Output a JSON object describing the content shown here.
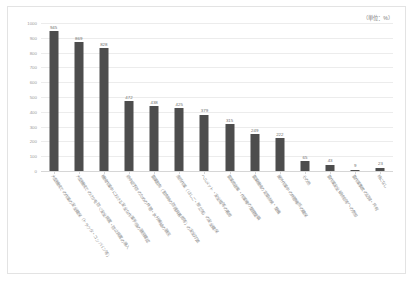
{
  "unit_caption": "（単位：%）",
  "chart_data": {
    "type": "bar",
    "title": "",
    "subtitle": "",
    "xlabel": "",
    "ylabel": "",
    "unit": "%",
    "grid": true,
    "legend": "none",
    "ylim": [
      0,
      1000
    ],
    "yticks": [
      0,
      100,
      200,
      300,
      400,
      500,
      600,
      700,
      800,
      900,
      1000
    ],
    "ytick_labels": [
      "0",
      "100",
      "200",
      "300",
      "400",
      "500",
      "600",
      "700",
      "800",
      "900",
      "1000"
    ],
    "categories": [
      "大型機械での作業の安全確保（トラクタ・コンバイン等）",
      "大型機械でのけがを防ぐ安全装置・防止装置の導入",
      "機械作業中における安全な作業手順の徹底確認",
      "熱中症予防のための休憩・水分補給の徹底",
      "農薬散布（散布時の防護具着用等）の安全対策",
      "高所作業（はしご・脚立等）の安全確保",
      "ヘルメット・安全帽等の着用",
      "農業用倉庫・作業場の整理整頓",
      "農業機械の定期点検・整備",
      "屋外作業中の休憩場所の確保",
      "その他",
      "農作業安全研修会等への参加",
      "農作業事故の記録・共有",
      "特になし"
    ],
    "values": [
      945,
      869,
      828,
      472,
      438,
      425,
      379,
      315,
      249,
      222,
      65,
      43,
      9,
      23
    ],
    "value_labels": [
      "945",
      "869",
      "828",
      "472",
      "438",
      "425",
      "379",
      "315",
      "249",
      "222",
      "65",
      "43",
      "9",
      "23"
    ],
    "bar_color": "#4d4d4d",
    "gridline_color": "#ececec",
    "background": "#ffffff"
  }
}
